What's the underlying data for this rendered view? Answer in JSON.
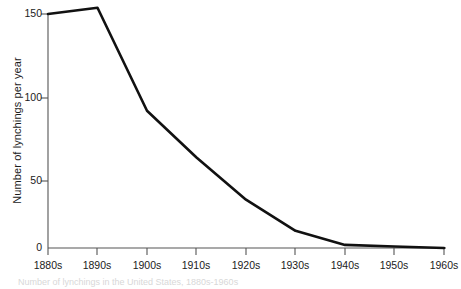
{
  "chart_data": {
    "type": "line",
    "title": "",
    "subtitle": "",
    "xlabel": "",
    "ylabel": "Number of lynchings per year",
    "categories": [
      "1880s",
      "1890s",
      "1900s",
      "1910s",
      "1920s",
      "1930s",
      "1940s",
      "1950s",
      "1960s"
    ],
    "values": [
      150,
      154,
      88,
      58,
      31,
      11,
      2,
      1,
      0
    ],
    "series": [
      {
        "name": "Number of lynchings per year",
        "values": [
          150,
          154,
          88,
          58,
          31,
          11,
          2,
          1,
          0
        ]
      }
    ],
    "ylim": [
      0,
      160
    ],
    "yticks": [
      0,
      50,
      100,
      150
    ],
    "ytick_labels": [
      "0",
      "50",
      "100",
      "150"
    ],
    "xtick_labels": [
      "1880s",
      "1890s",
      "1900s",
      "1910s",
      "1920s",
      "1930s",
      "1940s",
      "1950s",
      "1960s"
    ],
    "grid": false,
    "legend": "none",
    "line_color": "#111111",
    "line_width": 2.6,
    "axis_color": "#555555",
    "background_color": "#ffffff"
  },
  "caption": {
    "text": "Number of lynchings in the United States, 1880s-1960s"
  },
  "axes": {
    "y_title": "Number of lynchings per year"
  }
}
